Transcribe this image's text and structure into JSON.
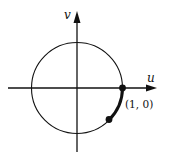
{
  "diagram": {
    "type": "unit-circle",
    "axes": {
      "horizontal_label": "u",
      "vertical_label": "v"
    },
    "points": [
      {
        "label": "(1, 0)"
      }
    ],
    "colors": {
      "stroke": "#111111",
      "background": "#ffffff"
    }
  }
}
